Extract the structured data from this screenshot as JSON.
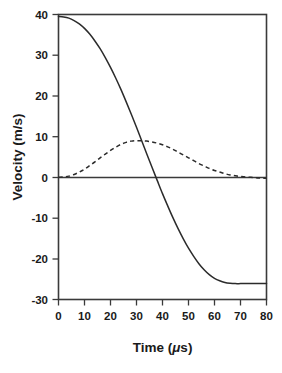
{
  "chart_data": {
    "type": "line",
    "title": "",
    "xlabel": "Time (μs)",
    "ylabel": "Velocity (m/s)",
    "xlim": [
      0,
      80
    ],
    "ylim": [
      -30,
      40
    ],
    "xticks": [
      0,
      10,
      20,
      30,
      40,
      50,
      60,
      70,
      80
    ],
    "yticks": [
      40,
      30,
      20,
      10,
      0,
      -10,
      -20,
      -30
    ],
    "xtick_labels": [
      "0",
      "10",
      "20",
      "30",
      "40",
      "50",
      "60",
      "70",
      "80"
    ],
    "ytick_labels": [
      "40",
      "30",
      "20",
      "10",
      "0",
      "-10",
      "-20",
      "-30"
    ],
    "grid": false,
    "legend": "none",
    "zero_line": true,
    "x_units": "μs",
    "y_units": "m/s",
    "series": [
      {
        "name": "solid-curve",
        "style": "solid",
        "color": "#2b2b2b",
        "x": [
          0,
          2,
          4,
          6,
          8,
          10,
          12,
          14,
          16,
          18,
          20,
          22,
          24,
          26,
          28,
          30,
          32,
          34,
          36,
          38,
          40,
          42,
          44,
          46,
          48,
          50,
          52,
          54,
          56,
          58,
          60,
          62,
          64,
          66,
          68,
          70,
          72,
          74,
          76,
          78,
          80
        ],
        "y": [
          39.5,
          39.4,
          39.1,
          38.5,
          37.7,
          36.6,
          35.2,
          33.5,
          31.6,
          29.4,
          27.0,
          24.4,
          21.6,
          18.6,
          15.5,
          12.3,
          9.0,
          5.7,
          2.4,
          -0.8,
          -4.0,
          -7.0,
          -9.9,
          -12.6,
          -15.1,
          -17.4,
          -19.4,
          -21.2,
          -22.7,
          -23.9,
          -24.8,
          -25.4,
          -25.8,
          -26.0,
          -26.1,
          -26.1,
          -26.1,
          -26.1,
          -26.1,
          -26.1,
          -26.1
        ]
      },
      {
        "name": "dashed-curve",
        "style": "dashed",
        "color": "#2b2b2b",
        "x": [
          0,
          2,
          4,
          6,
          8,
          10,
          12,
          14,
          16,
          18,
          20,
          22,
          24,
          26,
          28,
          30,
          32,
          34,
          36,
          38,
          40,
          42,
          44,
          46,
          48,
          50,
          52,
          54,
          56,
          58,
          60,
          62,
          64,
          66,
          68,
          70,
          72,
          74,
          76,
          78,
          80
        ],
        "y": [
          0.0,
          0.1,
          0.3,
          0.7,
          1.3,
          2.0,
          2.9,
          3.8,
          4.8,
          5.7,
          6.6,
          7.4,
          8.1,
          8.6,
          8.9,
          9.0,
          9.0,
          8.9,
          8.7,
          8.4,
          8.0,
          7.5,
          6.9,
          6.2,
          5.5,
          4.8,
          4.1,
          3.4,
          2.8,
          2.2,
          1.7,
          1.3,
          0.9,
          0.6,
          0.4,
          0.2,
          0.1,
          0.0,
          -0.1,
          -0.2,
          -0.2
        ]
      }
    ],
    "annotations": {
      "peak_dashed_x": 31,
      "peak_dashed_y": 9.0,
      "zero_crossing_solid_x": 38,
      "plateau_solid_y": -26.1,
      "start_solid_y": 39.5
    }
  }
}
